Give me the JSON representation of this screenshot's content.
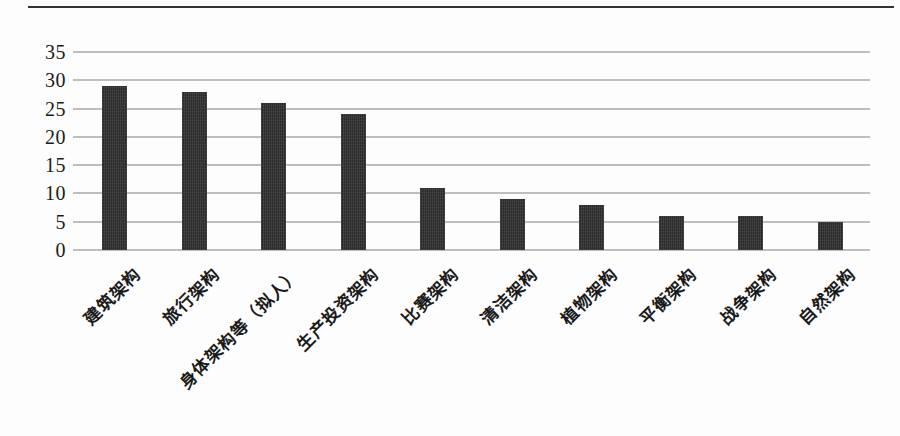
{
  "figure": {
    "background": "#fdfdfd",
    "top_rule_color": "#333333"
  },
  "chart_data": {
    "type": "bar",
    "title": "",
    "xlabel": "",
    "ylabel": "",
    "categories": [
      "建筑架构",
      "旅行架构",
      "身体架构等（拟人）",
      "生产投资架构",
      "比赛架构",
      "清洁架构",
      "植物架构",
      "平衡架构",
      "战争架构",
      "自然架构"
    ],
    "values": [
      29,
      28,
      26,
      24,
      11,
      9,
      8,
      6,
      6,
      5
    ],
    "ylim": [
      0,
      35
    ],
    "yticks": [
      0,
      5,
      10,
      15,
      20,
      25,
      30,
      35
    ],
    "grid": true,
    "legend": "none",
    "bar_color": "#333333",
    "gridline_color": "#b3b3b3",
    "text_color": "#1a1a1a",
    "xtick_rotation_deg": 45
  }
}
